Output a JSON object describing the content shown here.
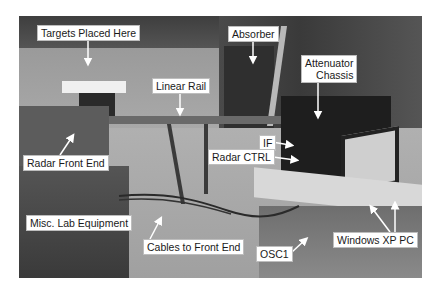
{
  "figure": {
    "labels": {
      "targets": "Targets Placed Here",
      "linear_rail": "Linear Rail",
      "absorber": "Absorber",
      "attenuator_line1": "Attenuator",
      "attenuator_line2": "Chassis",
      "if": "IF",
      "radar_ctrl": "Radar CTRL",
      "radar_front_end": "Radar Front End",
      "misc_lab": "Misc. Lab Equipment",
      "cables": "Cables to Front End",
      "osc1": "OSC1",
      "windows_pc": "Windows XP PC"
    },
    "colors": {
      "label_bg": "#ffffff",
      "label_text": "#1a1a1a",
      "arrow": "#ffffff"
    }
  }
}
